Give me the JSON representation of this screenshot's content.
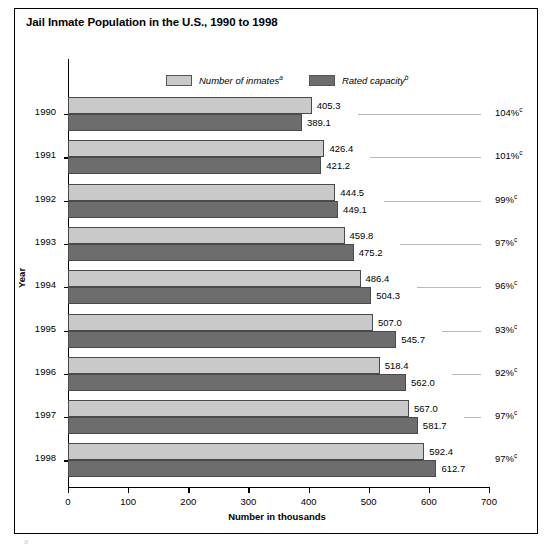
{
  "title": "Jail Inmate Population in the U.S., 1990 to 1998",
  "legend": [
    {
      "label": "Number of inmates",
      "sup": "a",
      "color": "#c9c9c9",
      "name": "inmates"
    },
    {
      "label": "Rated capacity",
      "sup": "b",
      "color": "#6d6d6d",
      "name": "capacity"
    }
  ],
  "axes": {
    "ylabel": "Year",
    "xlabel": "Number in thousands",
    "xticks": [
      0,
      100,
      200,
      300,
      400,
      500,
      600,
      700
    ],
    "xlim": [
      0,
      700
    ]
  },
  "chart_data": {
    "type": "bar",
    "orientation": "horizontal",
    "title": "Jail Inmate Population in the U.S., 1990 to 1998",
    "xlabel": "Number in thousands",
    "ylabel": "Year",
    "xlim": [
      0,
      700
    ],
    "xticks": [
      0,
      100,
      200,
      300,
      400,
      500,
      600,
      700
    ],
    "grid": false,
    "legend_position": "top-center",
    "categories": [
      "1990",
      "1991",
      "1992",
      "1993",
      "1994",
      "1995",
      "1996",
      "1997",
      "1998"
    ],
    "series": [
      {
        "name": "Number of inmates",
        "footnote": "a",
        "color": "#c9c9c9",
        "values": [
          405.3,
          426.4,
          444.5,
          459.8,
          486.4,
          507.0,
          518.4,
          567.0,
          592.4
        ]
      },
      {
        "name": "Rated capacity",
        "footnote": "b",
        "color": "#6d6d6d",
        "values": [
          389.1,
          421.2,
          449.1,
          475.2,
          504.3,
          545.7,
          562.0,
          581.7,
          612.7
        ]
      }
    ],
    "annotations": {
      "label": "Percent of capacity occupied",
      "footnote": "c",
      "values": [
        "104%",
        "101%",
        "99%",
        "97%",
        "96%",
        "93%",
        "92%",
        "97%",
        "97%"
      ]
    }
  },
  "footnote_partial": "a"
}
